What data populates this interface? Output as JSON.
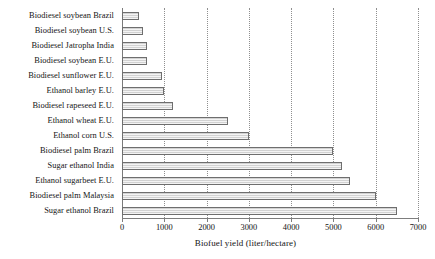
{
  "chart_data": {
    "type": "bar",
    "orientation": "horizontal",
    "title": "",
    "xlabel": "Biofuel yield (liter/hectare)",
    "ylabel": "",
    "xlim": [
      0,
      7000
    ],
    "xticks": [
      0,
      1000,
      2000,
      3000,
      4000,
      5000,
      6000,
      7000
    ],
    "xtick_labels": [
      "0",
      "1000",
      "2000",
      "3000",
      "4000",
      "5000",
      "6000",
      "7000"
    ],
    "grid": "vertical-dotted",
    "legend": "none",
    "categories": [
      "Biodiesel soybean Brazil",
      "Biodiesel soybean U.S.",
      "Biodiesel Jatropha India",
      "Biodiesel soybean E.U.",
      "Biodiesel sunflower E.U.",
      "Ethanol barley E.U.",
      "Biodiesel rapeseed E.U.",
      "Ethanol wheat E.U.",
      "Ethanol corn U.S.",
      "Biodiesel palm Brazil",
      "Sugar ethanol India",
      "Ethanol sugarbeet E.U.",
      "Biodiesel palm Malaysia",
      "Sugar ethanol Brazil"
    ],
    "values": [
      400,
      500,
      600,
      600,
      950,
      1000,
      1200,
      2500,
      3000,
      5000,
      5200,
      5400,
      6000,
      6500
    ],
    "bar_fill": "#e8e8e8",
    "bar_edge": "#6e6e6e",
    "grid_color": "#8f8f8f",
    "axis_color": "#7d7d7d"
  }
}
